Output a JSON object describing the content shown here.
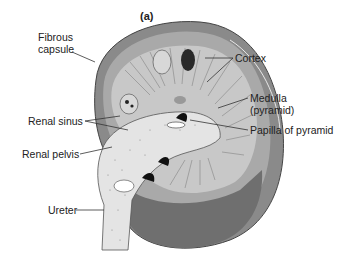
{
  "figure": {
    "panel_label": "(a)",
    "labels": {
      "fibrous_capsule_line1": "Fibrous",
      "fibrous_capsule_line2": "capsule",
      "cortex": "Cortex",
      "medulla_line1": "Medulla",
      "medulla_line2": "(pyramid)",
      "renal_sinus": "Renal sinus",
      "papilla": "Papilla of pyramid",
      "renal_pelvis": "Renal pelvis",
      "ureter": "Ureter"
    },
    "colors": {
      "capsule_outer": "#8a8a8a",
      "cortex": "#a9a9a9",
      "medulla": "#c8c8c8",
      "pelvis": "#e4e4e4",
      "lower_shell": "#6f6f6f",
      "line": "#333333"
    }
  }
}
